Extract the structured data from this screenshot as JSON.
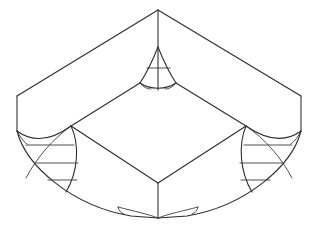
{
  "figure": {
    "title": "Isometric rounded-corner box with blended fillet corners",
    "type": "line-drawing",
    "background_color": "#ffffff",
    "line_color": "#2b2b2b",
    "thin_line_color": "#333333",
    "width": 319,
    "height": 238,
    "labels": [],
    "geometry": {
      "top_apex": [
        158,
        10
      ],
      "left_corner": [
        17,
        96
      ],
      "right_corner": [
        301,
        96
      ],
      "bottom_inner_corner": [
        158,
        183
      ],
      "bottom_cusp": [
        158,
        218
      ],
      "top_cusp": [
        158,
        47
      ],
      "left_edge_bottom": [
        17,
        131
      ],
      "right_edge_bottom": [
        301,
        131
      ],
      "inner_top_left": [
        71,
        126
      ],
      "inner_top_right": [
        246,
        126
      ],
      "top_outer_edges": [
        {
          "name": "apex-to-left",
          "from": [
            158,
            10
          ],
          "to": [
            17,
            96
          ]
        },
        {
          "name": "apex-to-right",
          "from": [
            158,
            10
          ],
          "to": [
            301,
            96
          ]
        }
      ],
      "inner_top_edges": [
        {
          "name": "inner-left-up",
          "from": [
            71,
            126
          ],
          "to": [
            140,
            83
          ]
        },
        {
          "name": "inner-right-up",
          "from": [
            246,
            126
          ],
          "to": [
            176,
            83
          ]
        },
        {
          "name": "inner-left-down",
          "from": [
            71,
            126
          ],
          "to": [
            158,
            183
          ]
        },
        {
          "name": "inner-right-down",
          "from": [
            246,
            126
          ],
          "to": [
            158,
            183
          ]
        }
      ],
      "vertical_edges": [
        {
          "name": "top-vertical",
          "from": [
            158,
            10
          ],
          "to": [
            158,
            90
          ]
        },
        {
          "name": "bottom-vertical",
          "from": [
            158,
            183
          ],
          "to": [
            158,
            218
          ]
        },
        {
          "name": "left-vertical",
          "from": [
            17,
            96
          ],
          "to": [
            17,
            131
          ]
        },
        {
          "name": "right-vertical",
          "from": [
            301,
            96
          ],
          "to": [
            301,
            131
          ]
        }
      ],
      "corner_blend_rulings": {
        "top_count": 1,
        "left_count": 3,
        "right_count": 3,
        "bottom_count": 1
      }
    }
  }
}
